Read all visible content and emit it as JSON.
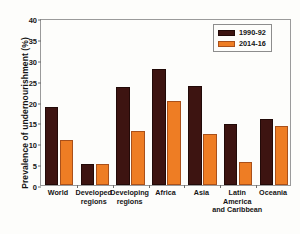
{
  "chart_data": {
    "type": "bar",
    "title": "",
    "xlabel": "",
    "ylabel": "Prevalence of undernourishment (%)",
    "ylim": [
      0,
      40
    ],
    "yticks": [
      0,
      5,
      10,
      15,
      20,
      25,
      30,
      35,
      40
    ],
    "grid": false,
    "legend_position": "top-right",
    "categories": [
      "World",
      "Developed\nregions",
      "Developing\nregions",
      "Africa",
      "Asia",
      "Latin\nAmerica\nand Caribbean",
      "Oceania"
    ],
    "series": [
      {
        "name": "1990-92",
        "color": "#3d1411",
        "values": [
          18.6,
          5.0,
          23.4,
          27.9,
          23.6,
          14.7,
          15.7
        ]
      },
      {
        "name": "2014-16",
        "color": "#ee7d24",
        "values": [
          10.9,
          5.0,
          12.9,
          20.2,
          12.1,
          5.5,
          14.2
        ]
      }
    ]
  }
}
